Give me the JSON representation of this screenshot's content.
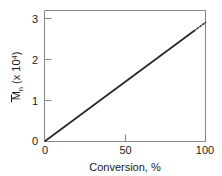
{
  "chart_data": {
    "type": "line",
    "title": "",
    "xlabel": "Conversion, %",
    "ylabel": "Mn (x 10^4)",
    "ylabel_base": "M",
    "ylabel_sub": "n",
    "ylabel_scale_open": " (x 10",
    "ylabel_scale_exp": "4",
    "ylabel_scale_close": ")",
    "xlim": [
      0,
      100
    ],
    "ylim": [
      0,
      3.3
    ],
    "xticks": [
      0,
      50,
      100
    ],
    "xtick_labels": [
      "0",
      "50",
      "100"
    ],
    "yticks": [
      0,
      1,
      2,
      3
    ],
    "ytick_labels": [
      "0",
      "1",
      "2",
      "3"
    ],
    "grid": false,
    "legend": "none",
    "series": [
      {
        "name": "measured",
        "style": "solid",
        "x": [
          0,
          93
        ],
        "values": [
          0.0,
          2.79
        ],
        "color": "#262626"
      },
      {
        "name": "extrapolated",
        "style": "dotted",
        "x": [
          93,
          100
        ],
        "values": [
          2.79,
          3.0
        ],
        "color": "#3a3a3a"
      }
    ],
    "annotations": []
  },
  "axes": {
    "x_axis_name": "conversion-axis",
    "y_axis_name": "molecular-weight-axis"
  }
}
